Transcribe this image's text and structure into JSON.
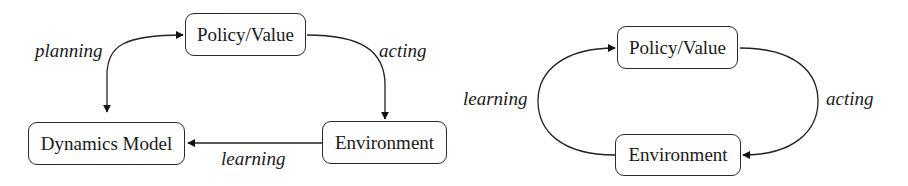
{
  "diagrams": [
    {
      "name": "model-based-loop",
      "nodes": {
        "policy_value": "Policy/Value",
        "dynamics_model": "Dynamics Model",
        "environment": "Environment"
      },
      "edges": [
        {
          "from": "Policy/Value",
          "to": "Dynamics Model",
          "label": "planning",
          "bidirectional": true
        },
        {
          "from": "Policy/Value",
          "to": "Environment",
          "label": "acting"
        },
        {
          "from": "Environment",
          "to": "Dynamics Model",
          "label": "learning"
        }
      ],
      "labels": {
        "planning": "planning",
        "acting": "acting",
        "learning": "learning"
      }
    },
    {
      "name": "model-free-loop",
      "nodes": {
        "policy_value": "Policy/Value",
        "environment": "Environment"
      },
      "edges": [
        {
          "from": "Policy/Value",
          "to": "Environment",
          "label": "acting"
        },
        {
          "from": "Environment",
          "to": "Policy/Value",
          "label": "learning"
        }
      ],
      "labels": {
        "learning": "learning",
        "acting": "acting"
      }
    }
  ]
}
